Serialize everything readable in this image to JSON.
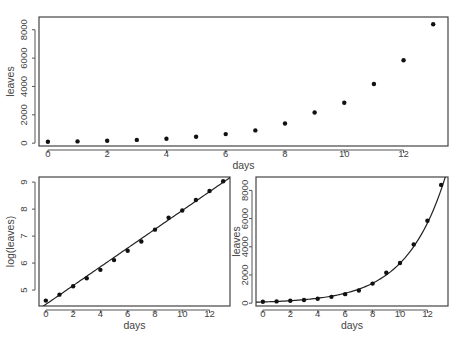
{
  "chart_data": [
    {
      "id": "top",
      "type": "scatter",
      "title": "",
      "xlabel": "days",
      "ylabel": "leaves",
      "xlim": [
        -0.3,
        13.5
      ],
      "ylim": [
        -200,
        8900
      ],
      "xticks": [
        0,
        2,
        4,
        6,
        8,
        10,
        12
      ],
      "yticks": [
        0,
        2000,
        4000,
        6000,
        8000
      ],
      "x": [
        0,
        1,
        2,
        3,
        4,
        5,
        6,
        7,
        8,
        9,
        10,
        11,
        12,
        13
      ],
      "y": [
        100,
        125,
        170,
        230,
        315,
        450,
        640,
        900,
        1390,
        2160,
        2850,
        4170,
        5850,
        8390
      ],
      "fit": null,
      "grid": false
    },
    {
      "id": "bottom-left",
      "type": "scatter",
      "title": "",
      "xlabel": "days",
      "ylabel": "log(leaves)",
      "xlim": [
        -0.5,
        13.5
      ],
      "ylim": [
        4.41,
        9.19
      ],
      "xticks": [
        0,
        2,
        4,
        6,
        8,
        10,
        12
      ],
      "yticks": [
        5,
        6,
        7,
        8,
        9
      ],
      "x": [
        0,
        1,
        2,
        3,
        4,
        5,
        6,
        7,
        8,
        9,
        10,
        11,
        12,
        13
      ],
      "y": [
        4.61,
        4.83,
        5.14,
        5.44,
        5.75,
        6.11,
        6.46,
        6.8,
        7.24,
        7.68,
        7.95,
        8.34,
        8.67,
        9.03
      ],
      "fit": {
        "type": "linear",
        "intercept": 4.47,
        "slope": 0.348
      },
      "grid": false
    },
    {
      "id": "bottom-right",
      "type": "scatter",
      "title": "",
      "xlabel": "days",
      "ylabel": "leaves",
      "xlim": [
        -0.5,
        13.5
      ],
      "ylim": [
        -200,
        8950
      ],
      "xticks": [
        0,
        2,
        4,
        6,
        8,
        10,
        12
      ],
      "yticks": [
        0,
        2000,
        4000,
        6000,
        8000
      ],
      "x": [
        0,
        1,
        2,
        3,
        4,
        5,
        6,
        7,
        8,
        9,
        10,
        11,
        12,
        13
      ],
      "y": [
        100,
        125,
        170,
        230,
        315,
        450,
        640,
        900,
        1390,
        2160,
        2850,
        4170,
        5850,
        8390
      ],
      "fit": {
        "type": "exponential",
        "intercept": 4.47,
        "slope": 0.348
      },
      "grid": false
    }
  ]
}
